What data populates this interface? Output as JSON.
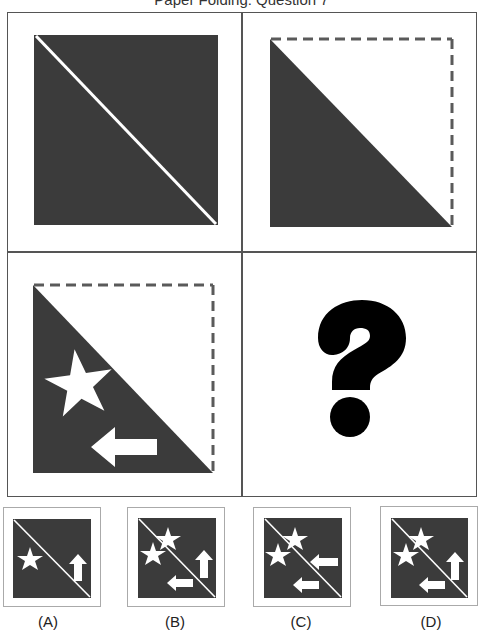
{
  "title": "Paper Folding: Question 7",
  "colors": {
    "paper_dark": "#3b3b3b",
    "paper_light": "#ffffff",
    "fold_dash": "#5a5a5a",
    "grid_border": "#555555",
    "option_border": "#aaaaaa",
    "question_mark": "#000000"
  },
  "steps": [
    {
      "id": "step-1",
      "description": "Dark square with a white diagonal fold line from top-left to bottom-right"
    },
    {
      "id": "step-2",
      "description": "Square folded along the diagonal: dark lower-left triangle, upper-right half shown as dashed outline"
    },
    {
      "id": "step-3",
      "description": "Folded triangle with a white star cut-out and a left-pointing arrow cut-out"
    },
    {
      "id": "step-4",
      "description": "Question mark",
      "glyph": "?"
    }
  ],
  "options": [
    {
      "label": "(A)",
      "shapes": [
        "star",
        "arrow-up"
      ]
    },
    {
      "label": "(B)",
      "shapes": [
        "star",
        "star",
        "arrow-up",
        "arrow-left"
      ]
    },
    {
      "label": "(C)",
      "shapes": [
        "star",
        "star",
        "arrow-left",
        "arrow-left"
      ]
    },
    {
      "label": "(D)",
      "shapes": [
        "star",
        "star",
        "arrow-up",
        "arrow-left"
      ]
    }
  ]
}
